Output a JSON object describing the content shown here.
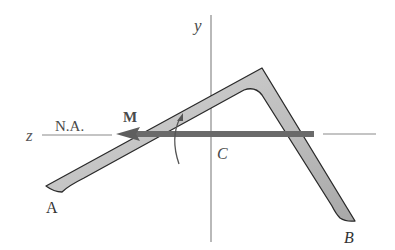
{
  "figure": {
    "labels": {
      "y_axis": "y",
      "z_axis": "z",
      "neutral_axis": "N.A.",
      "moment": "M",
      "centroid": "C",
      "end_a": "A",
      "end_b": "B"
    },
    "colors": {
      "axis_line": "#8a8a8a",
      "section_fill": "#c4c4c4",
      "section_stroke": "#2a2a2a",
      "moment_vector": "#6a6a6a",
      "label_text": "#4a4a4a"
    }
  }
}
